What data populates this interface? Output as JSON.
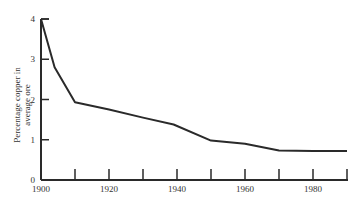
{
  "chart_data": {
    "type": "line",
    "title": "",
    "xlabel": "",
    "ylabel": "Percentage copper in average ore",
    "ylabel_lines": [
      "Percentage copper in",
      "average ore"
    ],
    "xlim": [
      1900,
      1990
    ],
    "ylim": [
      0,
      4
    ],
    "grid": false,
    "legend": null,
    "x_ticks": [
      1900,
      1910,
      1920,
      1930,
      1940,
      1950,
      1960,
      1970,
      1980,
      1990
    ],
    "x_tick_labels": [
      "1900",
      "",
      "1920",
      "",
      "1940",
      "",
      "1960",
      "",
      "1980",
      ""
    ],
    "y_ticks": [
      0,
      1,
      2,
      3,
      4
    ],
    "y_tick_labels": [
      "0",
      "1",
      "2",
      "3",
      "4"
    ],
    "series": [
      {
        "name": "Copper ore grade",
        "x": [
          1900,
          1904,
          1910,
          1920,
          1930,
          1939,
          1950,
          1960,
          1970,
          1980,
          1990
        ],
        "values": [
          4.0,
          2.8,
          1.93,
          1.75,
          1.55,
          1.38,
          0.98,
          0.9,
          0.73,
          0.72,
          0.72
        ]
      }
    ]
  },
  "colors": {
    "line": "#2a2a2a",
    "axis": "#2a2a2a",
    "text": "#333333",
    "background": "#ffffff"
  }
}
